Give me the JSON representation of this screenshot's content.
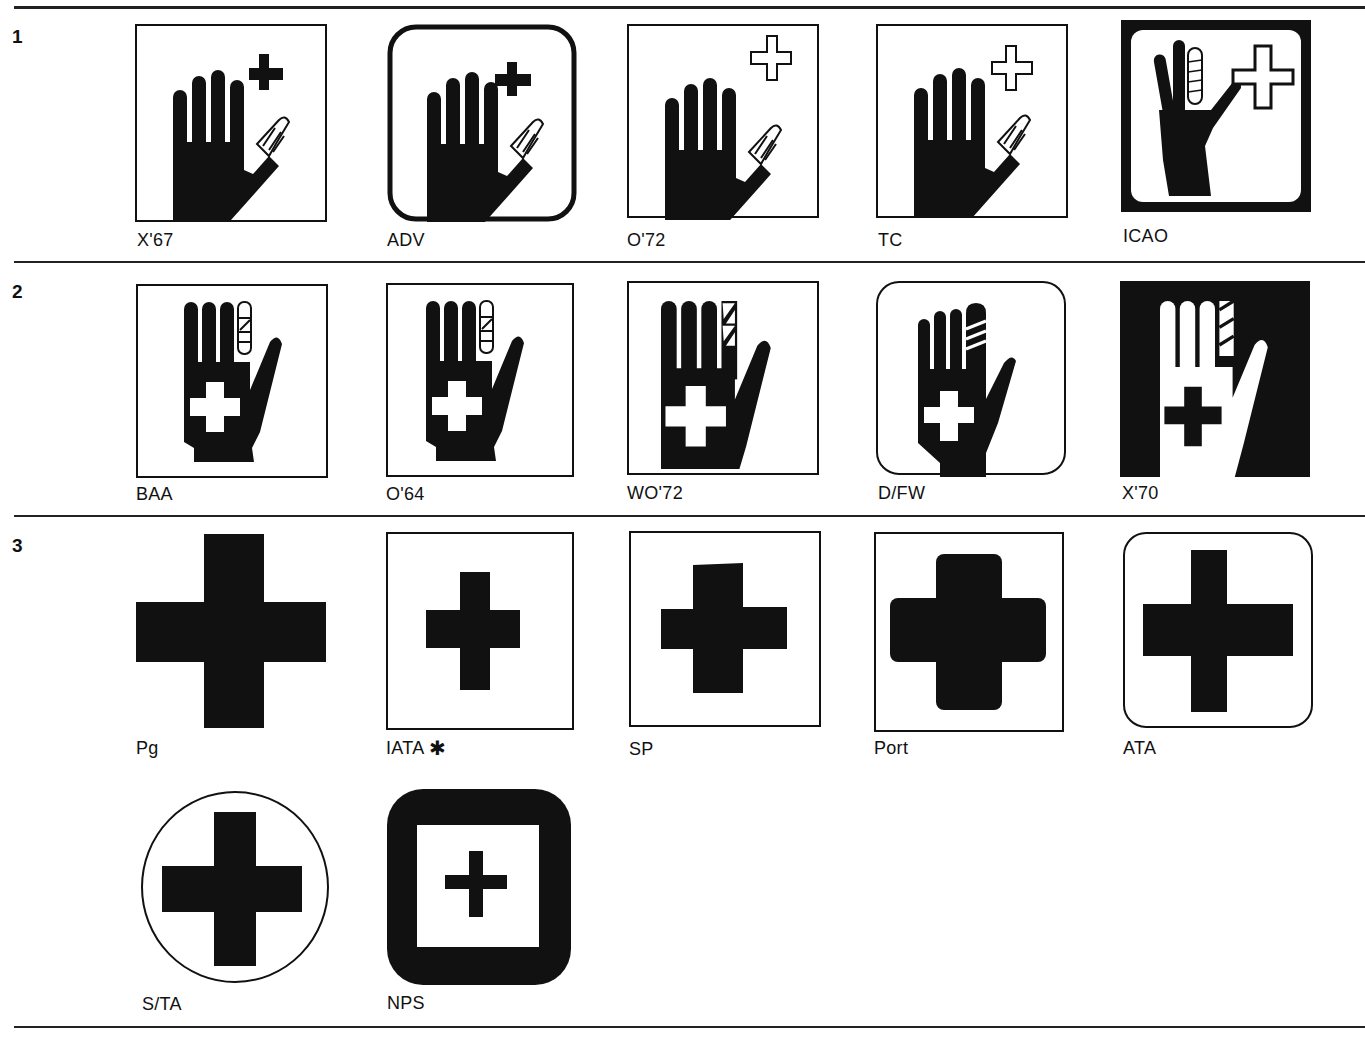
{
  "rows": [
    {
      "number": "1",
      "symbols": [
        {
          "label": "X'67",
          "icon": "hand-bandaged-thumb-solid-cross",
          "frame": "square"
        },
        {
          "label": "ADV",
          "icon": "hand-bandaged-thumb-solid-cross",
          "frame": "rounded-heavy"
        },
        {
          "label": "O'72",
          "icon": "hand-bandaged-thumb-outline-cross",
          "frame": "square"
        },
        {
          "label": "TC",
          "icon": "hand-bandaged-thumb-outline-cross",
          "frame": "square"
        },
        {
          "label": "ICAO",
          "icon": "hand-bandaged-finger-outline-cross",
          "frame": "black-border-rounded-inner"
        }
      ]
    },
    {
      "number": "2",
      "symbols": [
        {
          "label": "BAA",
          "icon": "hand-bandaged-finger-palm-cross",
          "frame": "square"
        },
        {
          "label": "O'64",
          "icon": "hand-bandaged-finger-palm-cross",
          "frame": "square"
        },
        {
          "label": "WO'72",
          "icon": "hand-bandaged-finger-palm-cross",
          "frame": "square"
        },
        {
          "label": "D/FW",
          "icon": "hand-bandaged-finger-palm-cross",
          "frame": "rounded"
        },
        {
          "label": "X'70",
          "icon": "hand-bandaged-finger-palm-cross-inverted",
          "frame": "black-fill"
        }
      ]
    },
    {
      "number": "3",
      "symbols": [
        {
          "label": "Pg",
          "icon": "cross",
          "frame": "none"
        },
        {
          "label": "IATA",
          "marker": "✱",
          "icon": "cross",
          "frame": "square"
        },
        {
          "label": "SP",
          "icon": "cross",
          "frame": "square"
        },
        {
          "label": "Port",
          "icon": "cross-rounded",
          "frame": "square"
        },
        {
          "label": "ATA",
          "icon": "cross",
          "frame": "rounded"
        },
        {
          "label": "S/TA",
          "icon": "cross",
          "frame": "circle"
        },
        {
          "label": "NPS",
          "icon": "cross",
          "frame": "heavy-rounded-black"
        }
      ]
    }
  ],
  "colors": {
    "ink": "#111111",
    "paper": "#ffffff"
  }
}
